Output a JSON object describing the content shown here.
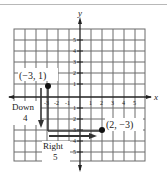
{
  "figure": {
    "axes": {
      "x_label": "x",
      "y_label": "y",
      "x_ticks": [
        "-3",
        "-2",
        "-1",
        "1",
        "2",
        "3",
        "4",
        "5"
      ],
      "y_ticks": [
        "5",
        "4",
        "3",
        "2",
        "1",
        "1",
        "2",
        "3",
        "4",
        "5"
      ],
      "x_range": [
        -6,
        6
      ],
      "y_range": [
        -6,
        6
      ]
    },
    "points": [
      {
        "label": "(−3, 1)",
        "x": -3,
        "y": 1
      },
      {
        "label": "(2, −3)",
        "x": 2,
        "y": -3
      }
    ],
    "moves": [
      {
        "direction": "Down",
        "amount": "4"
      },
      {
        "direction": "Right",
        "amount": "5"
      }
    ],
    "colors": {
      "grid": "#6a6a6a",
      "axis": "#222222",
      "path": "#333333"
    }
  }
}
